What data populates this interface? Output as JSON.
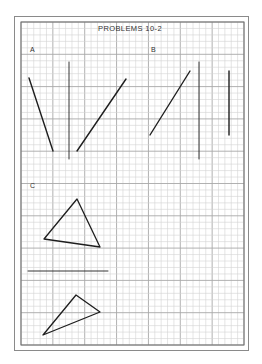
{
  "title": "PROBLEMS 10-2",
  "colors": {
    "background": "#ffffff",
    "border": "#8a8a8a",
    "grid_minor": "#d4d4d4",
    "grid_major": "#a8a8a8",
    "ink": "#1e1e1e"
  },
  "sections": [
    {
      "label": "A",
      "label_pos": [
        30,
        52
      ],
      "lines": [
        {
          "x1": 29,
          "y1": 78,
          "x2": 53,
          "y2": 151,
          "weight": "bold"
        },
        {
          "x1": 69,
          "y1": 62,
          "x2": 69,
          "y2": 159,
          "weight": "thin"
        },
        {
          "x1": 77,
          "y1": 151,
          "x2": 126,
          "y2": 79,
          "weight": "bold"
        }
      ]
    },
    {
      "label": "B",
      "label_pos": [
        151,
        52
      ],
      "lines": [
        {
          "x1": 150,
          "y1": 135,
          "x2": 190,
          "y2": 71,
          "weight": "bold"
        },
        {
          "x1": 199,
          "y1": 62,
          "x2": 199,
          "y2": 159,
          "weight": "thin"
        },
        {
          "x1": 229,
          "y1": 71,
          "x2": 229,
          "y2": 135,
          "weight": "bold"
        }
      ]
    },
    {
      "label": "C",
      "label_pos": [
        30,
        188
      ],
      "triangles": [
        {
          "points": "77,199 44,239 100,247"
        },
        {
          "points": "76,295 100,312 43,335"
        }
      ],
      "lines": [
        {
          "x1": 28,
          "y1": 271,
          "x2": 108,
          "y2": 271,
          "weight": "thin"
        }
      ]
    }
  ],
  "grid": {
    "x0": 21,
    "y0": 22,
    "x1": 244,
    "y1": 345,
    "cell": 6.45,
    "major_every": 5
  }
}
